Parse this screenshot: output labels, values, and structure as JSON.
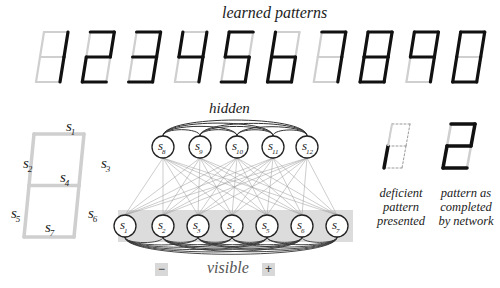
{
  "title": "learned patterns",
  "learned_patterns": [
    {
      "digit": "1",
      "segments": [
        0,
        0,
        1,
        0,
        0,
        1,
        0
      ]
    },
    {
      "digit": "2",
      "segments": [
        1,
        0,
        1,
        1,
        1,
        0,
        1
      ]
    },
    {
      "digit": "3",
      "segments": [
        1,
        0,
        1,
        1,
        0,
        1,
        1
      ]
    },
    {
      "digit": "4",
      "segments": [
        0,
        1,
        1,
        1,
        0,
        1,
        0
      ]
    },
    {
      "digit": "5",
      "segments": [
        1,
        1,
        0,
        1,
        0,
        1,
        1
      ]
    },
    {
      "digit": "6",
      "segments": [
        0,
        1,
        0,
        1,
        1,
        1,
        1
      ]
    },
    {
      "digit": "7",
      "segments": [
        1,
        0,
        1,
        0,
        0,
        1,
        0
      ]
    },
    {
      "digit": "8",
      "segments": [
        1,
        1,
        1,
        1,
        1,
        1,
        1
      ]
    },
    {
      "digit": "9",
      "segments": [
        1,
        1,
        1,
        1,
        0,
        1,
        0
      ]
    },
    {
      "digit": "0",
      "segments": [
        1,
        1,
        1,
        0,
        1,
        1,
        1
      ]
    }
  ],
  "segment_key": {
    "labels": [
      "s1",
      "s2",
      "s3",
      "s4",
      "s5",
      "s6",
      "s7"
    ]
  },
  "network": {
    "hidden_label": "hidden",
    "visible_label": "visible",
    "hidden_nodes": [
      "8",
      "9",
      "10",
      "11",
      "12"
    ],
    "visible_nodes": [
      "1",
      "2",
      "3",
      "4",
      "5",
      "6",
      "7"
    ],
    "minus_label": "−",
    "plus_label": "+"
  },
  "deficient": {
    "caption_lines": [
      "deficient",
      "pattern",
      "presented"
    ]
  },
  "completed": {
    "caption_lines": [
      "pattern as",
      "completed",
      "by network"
    ]
  },
  "colors": {
    "on": "#111111",
    "off": "#cfcfcf",
    "band": "#dcdcdc",
    "edge": "#9a9a9a"
  }
}
